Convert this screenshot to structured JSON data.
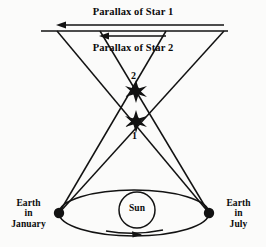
{
  "diagram": {
    "kind": "stellar-parallax-diagram",
    "background_color": "#fbfbfa",
    "stroke_color": "#121212",
    "labels": {
      "parallax_star_1": "Parallax of Star 1",
      "parallax_star_2": "Parallax of Star 2",
      "star_2_number": "2",
      "star_1_number": "1",
      "sun": "Sun",
      "earth_january_line1": "Earth",
      "earth_january_line2": "in",
      "earth_january_line3": "January",
      "earth_july_line1": "Earth",
      "earth_july_line2": "in",
      "earth_july_line3": "July"
    },
    "geometry": {
      "earth_january_point": {
        "x": 59,
        "y": 213
      },
      "earth_july_point": {
        "x": 209,
        "y": 213
      },
      "star_1_point": {
        "x": 136,
        "y": 121
      },
      "star_2_point": {
        "x": 136,
        "y": 91
      },
      "sun_center": {
        "x": 137,
        "y": 210
      },
      "sun_radius": 18,
      "orbit_center": {
        "x": 134,
        "y": 213
      },
      "orbit_radius_x": 75,
      "orbit_radius_y": 23,
      "background_plane_y": 31,
      "background_plane_x_start": 41,
      "background_plane_x_end": 228,
      "parallax1_arrow_y": 25,
      "parallax1_arrow_x_from": 224,
      "parallax1_arrow_x_to": 57,
      "parallax2_arrow_y": 36,
      "parallax2_arrow_x_from": 166,
      "parallax2_arrow_x_to": 100,
      "star1_sightline_left_end": {
        "x": 224,
        "y": 31
      },
      "star1_sightline_right_end": {
        "x": 57,
        "y": 31
      },
      "star2_sightline_left_end": {
        "x": 166,
        "y": 31
      },
      "star2_sightline_right_end": {
        "x": 100,
        "y": 31
      }
    }
  }
}
